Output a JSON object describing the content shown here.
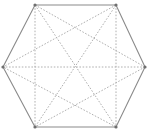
{
  "figure": {
    "shape_name": "regular hexagon",
    "graph_name": "complete graph K6",
    "vertex_count": 6,
    "outline_edge_count": 6,
    "diagonal_count": 9,
    "total_segment_count": 15,
    "background_color": "#ffffff",
    "outline_color": "#8a8a8a",
    "diagonal_color": "#b0b0b0",
    "vertex_color": "#6f6f6f",
    "outline_style": "solid",
    "diagonal_style": "dotted",
    "canvas": {
      "width": 148,
      "height": 134
    }
  },
  "chart_data": {
    "type": "scatter",
    "xlabel": "",
    "ylabel": "",
    "xlim": [
      0,
      148
    ],
    "ylim": [
      0,
      134
    ],
    "grid": false,
    "legend": false,
    "vertices": [
      {
        "id": "v1",
        "label": "top-left",
        "x": 35,
        "y": 5
      },
      {
        "id": "v2",
        "label": "top-right",
        "x": 116,
        "y": 5
      },
      {
        "id": "v3",
        "label": "right",
        "x": 145,
        "y": 67
      },
      {
        "id": "v4",
        "label": "bottom-right",
        "x": 116,
        "y": 127
      },
      {
        "id": "v5",
        "label": "bottom-left",
        "x": 35,
        "y": 127
      },
      {
        "id": "v6",
        "label": "left",
        "x": 3,
        "y": 67
      }
    ],
    "outline_edges": [
      {
        "from": "v1",
        "to": "v2",
        "style": "solid"
      },
      {
        "from": "v2",
        "to": "v3",
        "style": "solid"
      },
      {
        "from": "v3",
        "to": "v4",
        "style": "solid"
      },
      {
        "from": "v4",
        "to": "v5",
        "style": "solid"
      },
      {
        "from": "v5",
        "to": "v6",
        "style": "solid"
      },
      {
        "from": "v6",
        "to": "v1",
        "style": "solid"
      }
    ],
    "diagonals": [
      {
        "from": "v1",
        "to": "v3",
        "style": "dotted",
        "kind": "short"
      },
      {
        "from": "v1",
        "to": "v4",
        "style": "dotted",
        "kind": "long"
      },
      {
        "from": "v1",
        "to": "v5",
        "style": "dotted",
        "kind": "short"
      },
      {
        "from": "v2",
        "to": "v4",
        "style": "dotted",
        "kind": "short"
      },
      {
        "from": "v2",
        "to": "v5",
        "style": "dotted",
        "kind": "long"
      },
      {
        "from": "v2",
        "to": "v6",
        "style": "dotted",
        "kind": "short"
      },
      {
        "from": "v3",
        "to": "v5",
        "style": "dotted",
        "kind": "short"
      },
      {
        "from": "v3",
        "to": "v6",
        "style": "dotted",
        "kind": "long"
      },
      {
        "from": "v4",
        "to": "v6",
        "style": "dotted",
        "kind": "short"
      }
    ]
  }
}
